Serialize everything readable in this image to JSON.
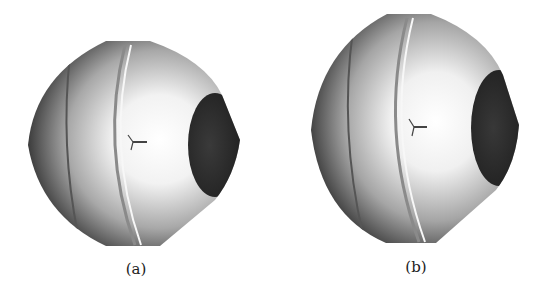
{
  "figure": {
    "panels": [
      {
        "id": "a",
        "label": "(a)",
        "description": "Spherical body with a flat dark circular face on the right, a curved seam ring, and a small coordinate triad at the center"
      },
      {
        "id": "b",
        "label": "(b)",
        "description": "Spherical body with a flat dark circular face on the right, a curved seam ring, and a small coordinate triad at the center (slightly different view)"
      }
    ],
    "colors": {
      "highlight": "#ffffff",
      "mid": "#b5b5b5",
      "shadow": "#3a3a3a",
      "face": "#2a2a2a",
      "seam": "#7a7a7a"
    }
  }
}
